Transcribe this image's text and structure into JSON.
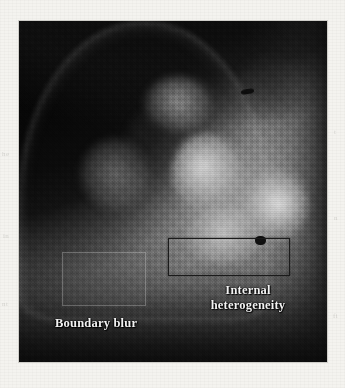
{
  "figure": {
    "kind": "grayscale-medical-scan",
    "modality_appearance": "ultrasound / low-resolution grayscale tomographic slice",
    "panel_bounds_px": {
      "left": 19,
      "top": 21,
      "width": 308,
      "height": 341
    },
    "page_background_hex": "#f4f3ef",
    "border_hex": "#cfcec9"
  },
  "annotations": {
    "boundary": {
      "label": "Boundary blur",
      "text_color_hex": "#f2f2f2",
      "roi_style": "faint light rectangle",
      "roi_bounds_px": {
        "left": 62,
        "top": 252,
        "width": 84,
        "height": 54
      }
    },
    "internal": {
      "label_line1": "Internal",
      "label_line2": "heterogeneity",
      "label_full": "Internal heterogeneity",
      "text_color_hex": "#f2f2f2",
      "roi_style": "solid dark outlined rectangle",
      "roi_outline_hex": "#1b1b1b",
      "roi_bounds_px": {
        "left": 168,
        "top": 238,
        "width": 122,
        "height": 38
      }
    }
  },
  "grayscale": {
    "darkest_hex": "#070707",
    "shadow_hex": "#1a1a1a",
    "midtone_hex": "#6a6a6a",
    "tissue_hex": "#949494",
    "highlight_hex": "#c2c2c2",
    "brightest_hex": "#c8c8c8"
  },
  "image_features": [
    {
      "name": "dome-shaped mass",
      "note": "rounded hemispherical structure occupying the frame"
    },
    {
      "name": "dark left wedge",
      "note": "near-black region at left and upper-left corner"
    },
    {
      "name": "bright core",
      "note": "high-echogenicity cluster right-of-centre"
    },
    {
      "name": "bright right nodule",
      "note": "brightest blob on right flank"
    },
    {
      "name": "focal dark mark",
      "note": "small dark linear defect high on the right"
    },
    {
      "name": "acoustic shadow",
      "note": "dark band across the lower edge"
    }
  ],
  "ghost_text": {
    "left_1": "he",
    "left_2": "in",
    "left_3": "nt",
    "right_1": "t",
    "right_2": "n",
    "right_3": "fi"
  }
}
